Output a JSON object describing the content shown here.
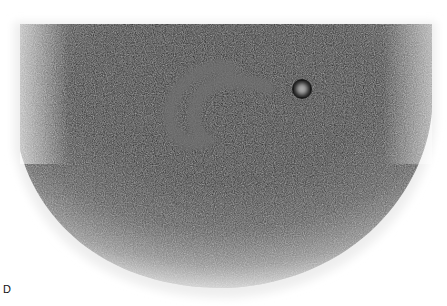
{
  "figure": {
    "panel_label": "D",
    "colors": {
      "background": "#ffffff",
      "dark_core": "#1c1c1c",
      "mid_gray": "#5a5a5a",
      "edge_gray": "#b5b5b5"
    }
  }
}
